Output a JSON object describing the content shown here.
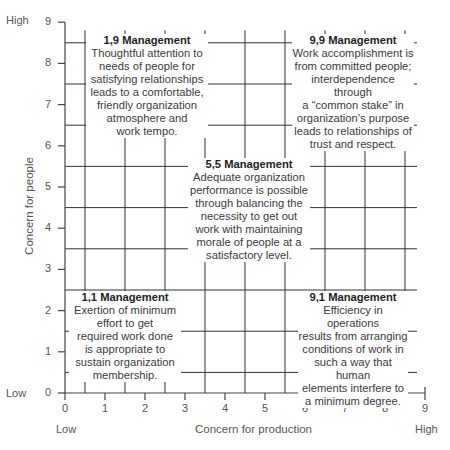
{
  "chart_data": {
    "type": "grid-diagram",
    "xlabel": "Concern for production",
    "ylabel": "Concern for people",
    "x_ticks": [
      "0",
      "1",
      "2",
      "3",
      "4",
      "5",
      "6",
      "7",
      "8",
      "9"
    ],
    "y_ticks": [
      "0",
      "1",
      "2",
      "3",
      "4",
      "5",
      "6",
      "7",
      "8",
      "9"
    ],
    "x_low": "Low",
    "x_high": "High",
    "y_low": "Low",
    "y_high": "High",
    "xlim": [
      0,
      9
    ],
    "ylim": [
      0,
      9
    ],
    "grid": true,
    "styles": [
      {
        "id": "1,9",
        "x": 1,
        "y": 9,
        "title": "1,9 Management",
        "lines": [
          "Thoughtful attention to",
          "needs of people for",
          "satisfying relationships",
          "leads to a comfortable,",
          "friendly organization",
          "atmosphere and",
          "work tempo."
        ]
      },
      {
        "id": "9,9",
        "x": 9,
        "y": 9,
        "title": "9,9 Management",
        "lines": [
          "Work accomplishment is",
          "from committed people;",
          "interdependence through",
          "a “common stake” in",
          "organization’s purpose",
          "leads to relationships of",
          "trust and respect."
        ]
      },
      {
        "id": "5,5",
        "x": 5,
        "y": 5,
        "title": "5,5 Management",
        "lines": [
          "Adequate organization",
          "performance is possible",
          "through balancing the",
          "necessity to get out",
          "work with maintaining",
          "morale of people at a",
          "satisfactory level."
        ]
      },
      {
        "id": "1,1",
        "x": 1,
        "y": 1,
        "title": "1,1 Management",
        "lines": [
          "Exertion of minimum",
          "effort to get",
          "required work done",
          "is appropriate to",
          "sustain organization",
          "membership."
        ]
      },
      {
        "id": "9,1",
        "x": 9,
        "y": 1,
        "title": "9,1 Management",
        "lines": [
          "Efficiency in operations",
          "results from arranging",
          "conditions of work in",
          "such a way that human",
          "elements interfere to",
          "a minimum degree."
        ]
      }
    ]
  },
  "labels": {
    "xlabel": "Concern for production",
    "ylabel": "Concern for people",
    "x_low": "Low",
    "x_high": "High",
    "y_low": "Low",
    "y_high": "High"
  }
}
